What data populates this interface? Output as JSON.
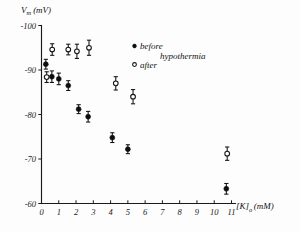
{
  "chart_data": {
    "type": "scatter",
    "title": "",
    "ylabel": "Vm (mV)",
    "ylabel_main": "V",
    "ylabel_sub": "m",
    "ylabel_unit": "(mV)",
    "xlabel": "[K]o (mM)",
    "xlabel_main": "[K]",
    "xlabel_sub": "o",
    "xlabel_unit": "(mM)",
    "grid": false,
    "ylim": [
      -100,
      -60
    ],
    "xlim": [
      0,
      11
    ],
    "y_ticks": [
      -100,
      -90,
      -80,
      -70,
      -60
    ],
    "y_tick_labels": [
      "-100",
      "-90",
      "-80",
      "-70",
      "-60"
    ],
    "x_ticks": [
      0,
      1,
      2,
      3,
      4,
      5,
      6,
      7,
      8,
      9,
      10,
      11
    ],
    "x_tick_labels": [
      "0",
      "1",
      "2",
      "3",
      "4",
      "5",
      "6",
      "7",
      "8",
      "9",
      "10",
      "11"
    ],
    "legend_position": "top-right",
    "legend_group_label": "hypothermia",
    "series": [
      {
        "name": "before",
        "marker": "filled-circle",
        "color": "#0d0d0d",
        "points": [
          {
            "x": 0.25,
            "y": -91.3,
            "yerr": 1.1
          },
          {
            "x": 0.6,
            "y": -88.5,
            "yerr": 1.3
          },
          {
            "x": 1.0,
            "y": -88.0,
            "yerr": 1.3
          },
          {
            "x": 1.55,
            "y": -86.5,
            "yerr": 1.1
          },
          {
            "x": 2.15,
            "y": -81.2,
            "yerr": 1.0
          },
          {
            "x": 2.7,
            "y": -79.5,
            "yerr": 1.2
          },
          {
            "x": 4.1,
            "y": -74.8,
            "yerr": 1.1
          },
          {
            "x": 5.0,
            "y": -72.2,
            "yerr": 1.0
          },
          {
            "x": 10.7,
            "y": -63.3,
            "yerr": 1.2
          }
        ]
      },
      {
        "name": "after",
        "marker": "open-circle",
        "color": "#141414",
        "points": [
          {
            "x": 0.3,
            "y": -88.4,
            "yerr": 1.2
          },
          {
            "x": 0.62,
            "y": -94.6,
            "yerr": 1.3
          },
          {
            "x": 1.55,
            "y": -94.6,
            "yerr": 1.2
          },
          {
            "x": 2.05,
            "y": -94.2,
            "yerr": 1.6
          },
          {
            "x": 2.75,
            "y": -95.0,
            "yerr": 1.7
          },
          {
            "x": 4.3,
            "y": -87.0,
            "yerr": 1.5
          },
          {
            "x": 5.3,
            "y": -84.0,
            "yerr": 1.6
          },
          {
            "x": 10.75,
            "y": -71.2,
            "yerr": 1.5
          }
        ]
      }
    ]
  },
  "legend": {
    "before_label": "before",
    "after_label": "after",
    "group_label": "hypothermia"
  }
}
